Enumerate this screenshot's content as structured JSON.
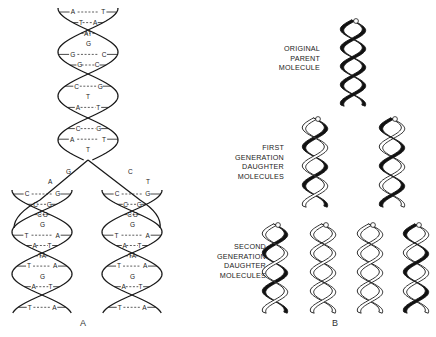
{
  "figure": {
    "panels": [
      {
        "id": "A",
        "caption": "A",
        "parent_helix": {
          "base_pairs": [
            [
              "A",
              "T"
            ],
            [
              "T",
              "A"
            ],
            [
              "A",
              "T"
            ],
            [
              "G",
              ""
            ],
            [
              "G",
              "C"
            ],
            [
              "G",
              "C"
            ],
            [
              "T",
              "A"
            ],
            [
              "C",
              "G"
            ],
            [
              "T",
              ""
            ],
            [
              "A",
              "T"
            ],
            [
              "G",
              "C"
            ],
            [
              "C",
              "G"
            ],
            [
              "A",
              "T"
            ],
            [
              "T",
              ""
            ],
            [
              "T",
              "A"
            ]
          ]
        },
        "fork_unpaired": {
          "left": [
            "G",
            "A"
          ],
          "right": [
            "C",
            "T"
          ]
        },
        "left_daughter": {
          "base_pairs": [
            [
              "C",
              "G"
            ],
            [
              "C",
              "G"
            ],
            [
              "C",
              "G"
            ],
            [
              "G",
              ""
            ],
            [
              "T",
              "A"
            ],
            [
              "A",
              "T"
            ],
            [
              "T",
              "A"
            ],
            [
              "T",
              "A"
            ],
            [
              "G",
              ""
            ],
            [
              "A",
              "T"
            ],
            [
              "T",
              "A"
            ],
            [
              "T",
              "A"
            ]
          ]
        },
        "right_daughter": {
          "base_pairs": [
            [
              "C",
              "G"
            ],
            [
              "C",
              "G"
            ],
            [
              "C",
              "G"
            ],
            [
              "G",
              ""
            ],
            [
              "T",
              "A"
            ],
            [
              "A",
              "T"
            ],
            [
              "T",
              "A"
            ],
            [
              "T",
              "A"
            ],
            [
              "G",
              ""
            ],
            [
              "A",
              "T"
            ],
            [
              "T",
              "A"
            ],
            [
              "T",
              "A"
            ]
          ]
        }
      },
      {
        "id": "B",
        "caption": "B",
        "rows": [
          {
            "label": [
              "ORIGINAL",
              "PARENT",
              "MOLECULE"
            ],
            "molecules": [
              {
                "strands": [
                  "dark",
                  "dark"
                ]
              }
            ]
          },
          {
            "label": [
              "FIRST",
              "GENERATION",
              "DAUGHTER",
              "MOLECULES"
            ],
            "molecules": [
              {
                "strands": [
                  "dark",
                  "light"
                ]
              },
              {
                "strands": [
                  "light",
                  "dark"
                ]
              }
            ]
          },
          {
            "label": [
              "SECOND",
              "GENERATION",
              "DAUGHTER",
              "MOLECULES"
            ],
            "molecules": [
              {
                "strands": [
                  "dark",
                  "light"
                ]
              },
              {
                "strands": [
                  "light",
                  "light"
                ]
              },
              {
                "strands": [
                  "light",
                  "light"
                ]
              },
              {
                "strands": [
                  "light",
                  "dark"
                ]
              }
            ]
          }
        ]
      }
    ],
    "colors": {
      "ink": "#1a1a1a",
      "light_strand": "#ffffff",
      "dark_strand": "#111111",
      "background": "#ffffff"
    }
  }
}
